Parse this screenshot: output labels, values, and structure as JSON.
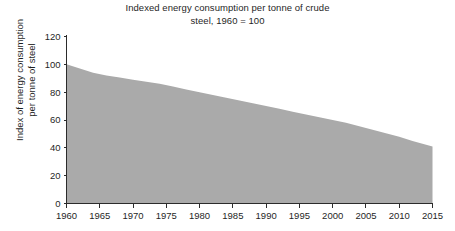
{
  "chart_data": {
    "type": "area",
    "title": "Indexed energy consumption per tonne of crude\nsteel, 1960 = 100",
    "xlabel": "",
    "ylabel": "Index of energy consumption\nper tonne of steel",
    "xlim": [
      1960,
      2015
    ],
    "ylim": [
      0,
      120
    ],
    "grid": false,
    "legend": "none",
    "fill_color": "#aaaaaa",
    "axis_color": "#2b2b2b",
    "background_color": "#ffffff",
    "x_ticks": [
      1960,
      1965,
      1970,
      1975,
      1980,
      1985,
      1990,
      1995,
      2000,
      2005,
      2010,
      2015
    ],
    "x_tick_labels": [
      "1960",
      "1965",
      "1970",
      "1975",
      "1980",
      "1985",
      "1990",
      "1995",
      "2000",
      "2005",
      "2010",
      "2015"
    ],
    "y_ticks": [
      0,
      20,
      40,
      60,
      80,
      100,
      120
    ],
    "y_tick_labels": [
      "0",
      "20",
      "40",
      "60",
      "80",
      "100",
      "120"
    ],
    "series": [
      {
        "name": "Index of energy consumption per tonne of steel",
        "x": [
          1960,
          1962,
          1964,
          1966,
          1968,
          1970,
          1972,
          1974,
          1976,
          1978,
          1980,
          1982,
          1984,
          1986,
          1988,
          1990,
          1992,
          1994,
          1996,
          1998,
          2000,
          2002,
          2004,
          2006,
          2008,
          2010,
          2012,
          2015
        ],
        "values": [
          100,
          97,
          94,
          92,
          90.5,
          89,
          87.5,
          86,
          84,
          82,
          80,
          78,
          76,
          74,
          72,
          70,
          68,
          66,
          64,
          62,
          60,
          58,
          55.5,
          53,
          50.5,
          48,
          45,
          41
        ]
      }
    ]
  }
}
